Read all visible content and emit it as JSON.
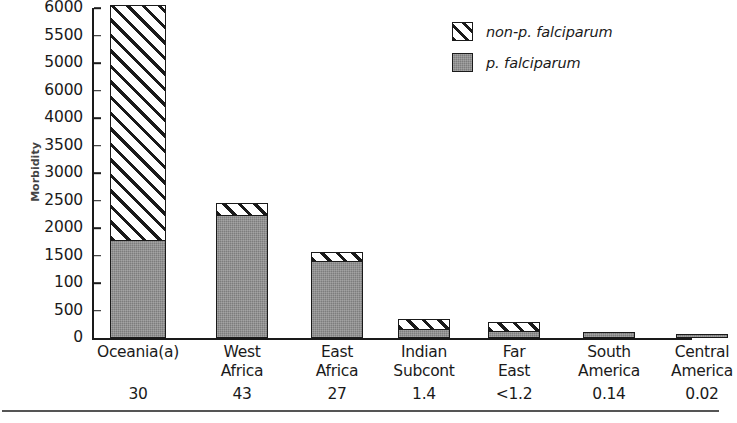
{
  "chart_data": {
    "type": "bar",
    "subtype": "stacked-vertical",
    "title": "",
    "xlabel": "",
    "ylabel": "Morbidity",
    "ylim": [
      0,
      6000
    ],
    "grid": false,
    "legend_position": "top-right",
    "categories": [
      "Oceania(a)",
      "West Africa",
      "East Africa",
      "Indian Subcont",
      "Far East",
      "South America",
      "Central America"
    ],
    "category_lines": [
      [
        "Oceania(a)",
        ""
      ],
      [
        "West",
        "Africa"
      ],
      [
        "East",
        "Africa"
      ],
      [
        "Indian",
        "Subcont"
      ],
      [
        "Far",
        "East"
      ],
      [
        "South",
        "America"
      ],
      [
        "Central",
        "America"
      ]
    ],
    "category_values": [
      "30",
      "43",
      "27",
      "1.4",
      "<1.2",
      "0.14",
      "0.02"
    ],
    "y_tick_labels": [
      "6000",
      "5500",
      "5000",
      "6000",
      "4000",
      "3500",
      "3000",
      "2500",
      "2000",
      "1500",
      "100",
      "500",
      "0"
    ],
    "y_tick_values": [
      6000,
      5500,
      5000,
      4500,
      4000,
      3500,
      3000,
      2500,
      2000,
      1500,
      1000,
      500,
      0
    ],
    "series": [
      {
        "name": "p. falciparum",
        "pattern": "solid-gray",
        "color": "#7d7d7d",
        "values": [
          1760,
          2210,
          1380,
          150,
          110,
          110,
          65
        ]
      },
      {
        "name": "non-p. falciparum",
        "pattern": "diagonal-hatch",
        "color": "#ffffff",
        "values": [
          4290,
          250,
          180,
          190,
          190,
          0,
          0
        ]
      }
    ],
    "totals": [
      6050,
      2460,
      1560,
      340,
      300,
      110,
      65
    ]
  },
  "legend": {
    "items": [
      {
        "label": "non-p. falciparum",
        "pattern": "diagonal-hatch"
      },
      {
        "label": "p. falciparum",
        "pattern": "solid-gray"
      }
    ]
  },
  "axis": {
    "y_title": "Morbidity"
  },
  "colors": {
    "ink": "#1a1a1a",
    "gray_fill": "#7d7d7d",
    "background": "#ffffff",
    "rule": "#555555"
  }
}
